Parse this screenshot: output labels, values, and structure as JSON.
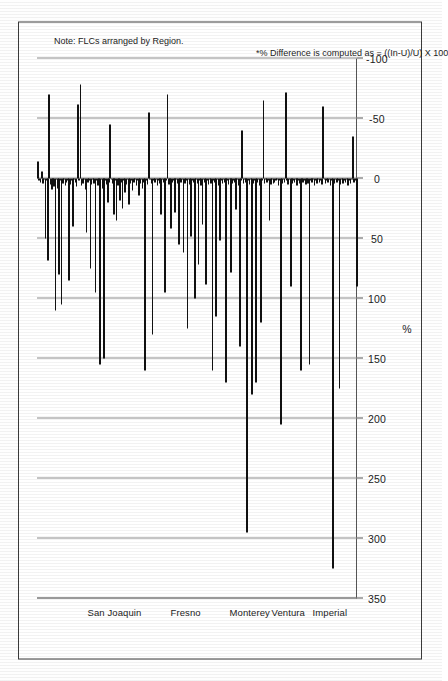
{
  "chart_data": {
    "type": "bar",
    "orientation": "horizontal",
    "title": "",
    "xlabel": "%",
    "ylabel": "",
    "xlim": [
      -100,
      350
    ],
    "x_ticks": [
      350,
      300,
      250,
      200,
      150,
      100,
      50,
      0,
      -50,
      -100
    ],
    "x_tick_labels": [
      "350",
      "300",
      "250",
      "200",
      "150",
      "100",
      "50",
      "0",
      "-50",
      "-100"
    ],
    "grid": true,
    "legend": null,
    "bar_color": "#111111",
    "axis_color": "#555555",
    "gridline_color": "#8a8a8a",
    "categories_note": "Each bar is one FLC (Farm Labor Contractor); categories unlabeled individually.",
    "region_groups": [
      {
        "label": "San Joaquin",
        "start_index": 0,
        "end_index": 39
      },
      {
        "label": "Fresno",
        "start_index": 40,
        "end_index": 68
      },
      {
        "label": "Monterey",
        "start_index": 69,
        "end_index": 84
      },
      {
        "label": "Ventura",
        "start_index": 85,
        "end_index": 99
      },
      {
        "label": "Imperial",
        "start_index": 100,
        "end_index": 113
      }
    ],
    "values": [
      -14,
      2,
      3,
      -6,
      4,
      1,
      50,
      2,
      68,
      -70,
      5,
      9,
      3,
      7,
      110,
      1,
      8,
      80,
      2,
      105,
      4,
      1,
      6,
      3,
      2,
      85,
      5,
      2,
      40,
      1,
      3,
      7,
      -62,
      2,
      -78,
      6,
      4,
      1,
      9,
      45,
      3,
      2,
      75,
      5,
      1,
      4,
      95,
      2,
      6,
      3,
      155,
      1,
      8,
      150,
      2,
      5,
      20,
      3,
      -45,
      1,
      4,
      30,
      2,
      35,
      6,
      1,
      18,
      3,
      25,
      2,
      12,
      5,
      1,
      22,
      4,
      2,
      10,
      3,
      1,
      6,
      2,
      14,
      4,
      1,
      8,
      3,
      160,
      2,
      5,
      -55,
      1,
      4,
      130,
      2,
      3,
      1,
      6,
      2,
      4,
      30,
      1,
      3,
      95,
      2,
      -70,
      5,
      1,
      42,
      3,
      2,
      28,
      1,
      4,
      55,
      2,
      3,
      1,
      62,
      4,
      2,
      125,
      1,
      5,
      48,
      2,
      3,
      100,
      1,
      4,
      72,
      2,
      6,
      38,
      1,
      3,
      88,
      2,
      5,
      1,
      4,
      160,
      2,
      3,
      115,
      1,
      6,
      52,
      2,
      4,
      1,
      3,
      170,
      2,
      5,
      1,
      78,
      4,
      2,
      3,
      26,
      1,
      6,
      140,
      2,
      -40,
      4,
      1,
      3,
      295,
      2,
      5,
      1,
      180,
      4,
      2,
      170,
      3,
      1,
      6,
      120,
      2,
      -65,
      4,
      1,
      3,
      2,
      35,
      5,
      1,
      4,
      3,
      2,
      1,
      6,
      2,
      205,
      4,
      1,
      3,
      -72,
      2,
      5,
      1,
      90,
      4,
      2,
      3,
      1,
      6,
      2,
      4,
      160,
      1,
      3,
      2,
      5,
      1,
      4,
      155,
      2,
      3,
      1,
      6,
      2,
      4,
      1,
      3,
      2,
      5,
      -60,
      1,
      4,
      2,
      3,
      1,
      6,
      2,
      325,
      4,
      1,
      3,
      2,
      175,
      5,
      1,
      4,
      2,
      3,
      1,
      6,
      2,
      4,
      1,
      -35,
      3,
      2,
      90
    ]
  },
  "axis": {
    "value_axis_title": "%",
    "tick_labels": [
      "350",
      "300",
      "250",
      "200",
      "150",
      "100",
      "50",
      "0",
      "-50",
      "-100"
    ]
  },
  "regions": [
    {
      "label": "San Joaquin"
    },
    {
      "label": "Fresno"
    },
    {
      "label": "Monterey"
    },
    {
      "label": "Ventura"
    },
    {
      "label": "Imperial"
    }
  ],
  "annotations": {
    "region_note": "Note: FLCs arranged by Region.",
    "footnote": "*% Difference is computed as = ((In-U)/U) X 100"
  }
}
